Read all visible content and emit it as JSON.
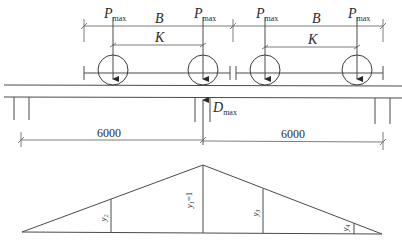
{
  "diagram": {
    "title": "",
    "loads": [
      {
        "symbol": "P",
        "subscript": "max"
      },
      {
        "symbol": "P",
        "subscript": "max"
      },
      {
        "symbol": "P",
        "subscript": "max"
      },
      {
        "symbol": "P",
        "subscript": "max"
      }
    ],
    "dimensions": {
      "wheelbase_B": "B",
      "wheel_spacing_K": "K",
      "span_left": "6000",
      "span_right": "6000"
    },
    "reaction": {
      "symbol": "D",
      "subscript": "max"
    },
    "influence_line": {
      "ordinates": [
        {
          "label": "y2"
        },
        {
          "label": "y1=1"
        },
        {
          "label": "y3"
        },
        {
          "label": "y4"
        }
      ],
      "y1_symbol": "y",
      "y1_sub": "1",
      "y1_value": "=1",
      "y2_symbol": "y",
      "y2_sub": "2",
      "y3_symbol": "y",
      "y3_sub": "3",
      "y4_symbol": "y",
      "y4_sub": "4"
    }
  }
}
